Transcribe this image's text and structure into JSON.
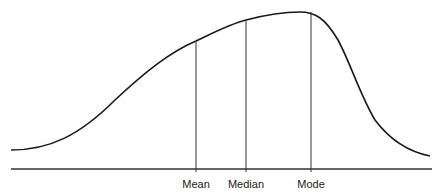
{
  "diagram": {
    "title": "",
    "type": "negatively skewed distribution",
    "curve_color": "#1a1a1a",
    "markers": [
      {
        "label": "Mean",
        "x": 196,
        "top": 41
      },
      {
        "label": "Median",
        "x": 246,
        "top": 20
      },
      {
        "label": "Mode",
        "x": 311,
        "top": 12
      }
    ],
    "baseline_y": 169
  }
}
